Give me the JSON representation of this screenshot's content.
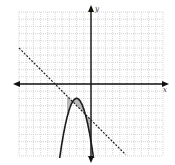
{
  "axes": {
    "x_label": "x",
    "y_label": "y",
    "x_range": [
      -10,
      10
    ],
    "y_range": [
      -10,
      10
    ],
    "grid_step": 1
  },
  "chart_data": {
    "type": "line",
    "title": "",
    "xlabel": "x",
    "ylabel": "y",
    "xlim": [
      -10,
      10
    ],
    "ylim": [
      -10,
      10
    ],
    "grid": true,
    "series": [
      {
        "name": "parabola",
        "style": "solid",
        "equation": "y = -1.5(x+2)^2 - 2",
        "vertex": [
          -2,
          -2
        ]
      },
      {
        "name": "line",
        "style": "dashed",
        "equation": "y = -x - 5",
        "slope": -1,
        "intercept": -5
      }
    ],
    "shaded_region": "between the dashed line and the parabola (above line, below parabola)"
  },
  "colors": {
    "grid": "#bbbbbb",
    "axis": "#111111",
    "curve": "#1a1a1a",
    "shade": "#b8b8b8"
  }
}
